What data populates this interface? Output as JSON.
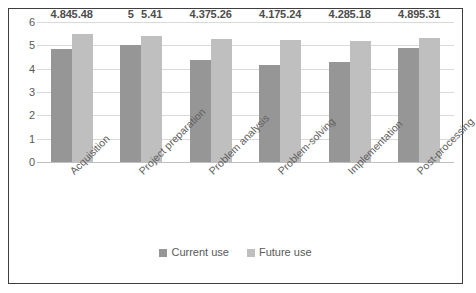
{
  "chart_data": {
    "type": "bar",
    "title": "",
    "xlabel": "",
    "ylabel": "",
    "ylim": [
      0,
      6
    ],
    "ytick_labels": [
      "6",
      "5",
      "4",
      "3",
      "2",
      "1",
      "0"
    ],
    "yticks": [
      6,
      5,
      4,
      3,
      2,
      1,
      0
    ],
    "grid": true,
    "legend_position": "bottom-center",
    "categories": [
      "Acquisition",
      "Project preparation",
      "Problem analysis",
      "Problem-solving",
      "Implementation",
      "Post-processing"
    ],
    "series": [
      {
        "name": "Current use",
        "color": "#969696",
        "values": [
          4.84,
          5,
          4.37,
          4.17,
          4.28,
          4.89
        ],
        "labels": [
          "4.84",
          "5",
          "4.37",
          "4.17",
          "4.28",
          "4.89"
        ]
      },
      {
        "name": "Future use",
        "color": "#bfbfbf",
        "values": [
          5.48,
          5.41,
          5.26,
          5.24,
          5.18,
          5.31
        ],
        "labels": [
          "5.48",
          "5.41",
          "5.26",
          "5.24",
          "5.18",
          "5.31"
        ]
      }
    ]
  }
}
